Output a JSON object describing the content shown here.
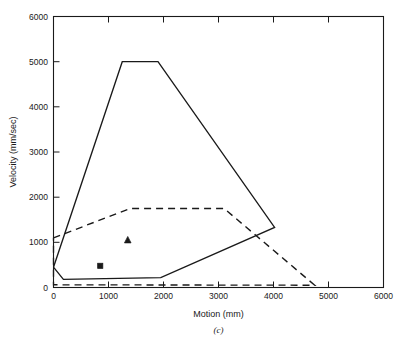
{
  "figure": {
    "caption": "(c)"
  },
  "chart_data": {
    "type": "line",
    "title": "",
    "xlabel": "Motion (mm)",
    "ylabel": "Velocity (mm/sec)",
    "xlim": [
      0,
      6000
    ],
    "ylim": [
      0,
      6000
    ],
    "xticks": [
      0,
      1000,
      2000,
      3000,
      4000,
      5000,
      6000
    ],
    "yticks": [
      0,
      1000,
      2000,
      3000,
      4000,
      5000,
      6000
    ],
    "xtick_labels": [
      "0",
      "1000",
      "2000",
      "3000",
      "4000",
      "5000",
      "6000"
    ],
    "ytick_labels": [
      "0",
      "1000",
      "2000",
      "3000",
      "4000",
      "5000",
      "6000"
    ],
    "grid": false,
    "legend": "none",
    "series": [
      {
        "name": "solid-envelope",
        "style": "solid",
        "color": "#1a1a1a",
        "closed": true,
        "points": [
          [
            0,
            450
          ],
          [
            180,
            180
          ],
          [
            1950,
            220
          ],
          [
            4020,
            1330
          ],
          [
            1900,
            5000
          ],
          [
            1250,
            5000
          ],
          [
            0,
            450
          ]
        ]
      },
      {
        "name": "dashed-envelope",
        "style": "dashed",
        "color": "#1a1a1a",
        "closed": true,
        "points": [
          [
            0,
            1100
          ],
          [
            1400,
            1750
          ],
          [
            3100,
            1750
          ],
          [
            4750,
            50
          ],
          [
            0,
            60
          ],
          [
            0,
            1100
          ]
        ]
      }
    ],
    "markers": [
      {
        "name": "triangle-point",
        "shape": "triangle",
        "x": 1350,
        "y": 1050,
        "color": "#1a1a1a"
      },
      {
        "name": "square-point",
        "shape": "square",
        "x": 850,
        "y": 480,
        "color": "#1a1a1a"
      }
    ]
  }
}
